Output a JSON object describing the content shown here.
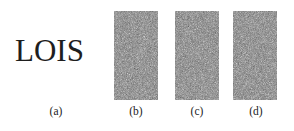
{
  "figure": {
    "subfigures": [
      {
        "id": "a",
        "label": "(a)",
        "content": "LOIS",
        "type": "text"
      },
      {
        "id": "b",
        "label": "(b)",
        "type": "noise-image"
      },
      {
        "id": "c",
        "label": "(c)",
        "type": "noise-image"
      },
      {
        "id": "d",
        "label": "(d)",
        "type": "noise-image"
      }
    ]
  },
  "colors": {
    "noise_base": "#7a7a7a",
    "text": "#1e1e1e"
  }
}
